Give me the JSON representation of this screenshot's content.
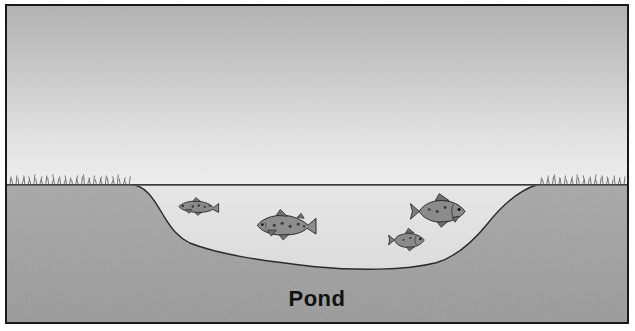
{
  "illustration": {
    "title": "Pond",
    "caption_label": "Pond",
    "scene_type": "pond cross-section diagram",
    "palette": {
      "sky_top": "#b6b6b6",
      "sky_bottom": "#ececec",
      "water": "#e2e2e2",
      "ground": "#a3a3a3",
      "ground_shadow": "#989898",
      "outline": "#1a1a1a",
      "grass": "#6f6f6f",
      "fish_body": "#8f8f8f",
      "fish_dark": "#4a4a4a",
      "frame_border": "#1a1a1a",
      "page_background": "#ffffff"
    },
    "regions": [
      {
        "name": "sky",
        "label": "Sky"
      },
      {
        "name": "water",
        "label": "Pond water"
      },
      {
        "name": "ground",
        "label": "Soil / bank"
      },
      {
        "name": "left-bank-grass",
        "label": "Grass on left bank"
      },
      {
        "name": "right-bank-grass",
        "label": "Grass on right bank"
      },
      {
        "name": "waterline",
        "label": "Water surface line"
      }
    ],
    "fish": [
      {
        "id": "fish-1",
        "kind": "trout",
        "size": "small",
        "facing": "left",
        "x": 178,
        "y": 206
      },
      {
        "id": "fish-2",
        "kind": "trout",
        "size": "large",
        "facing": "left",
        "x": 267,
        "y": 228
      },
      {
        "id": "fish-3",
        "kind": "bass",
        "size": "large",
        "facing": "right",
        "x": 437,
        "y": 210
      },
      {
        "id": "fish-4",
        "kind": "bass",
        "size": "small",
        "facing": "right",
        "x": 406,
        "y": 238
      }
    ],
    "fish_count": 4,
    "dimensions": {
      "width": 635,
      "height": 331
    }
  }
}
